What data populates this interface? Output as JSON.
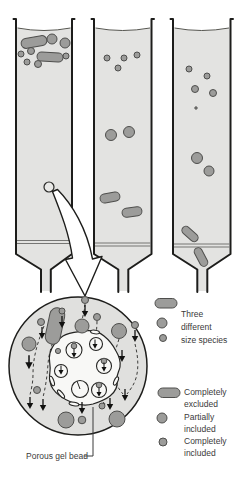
{
  "legend_species": {
    "lines": [
      "Three",
      "different",
      "size species"
    ]
  },
  "legend_inclusion": {
    "items": [
      {
        "shape": "rod",
        "line1": "Completely",
        "line2": "excluded"
      },
      {
        "shape": "medium-circle",
        "line1": "Partially",
        "line2": "included"
      },
      {
        "shape": "small-circle",
        "line1": "Completely",
        "line2": "included"
      }
    ]
  },
  "inset": {
    "label": "Porous gel bead"
  },
  "colors": {
    "background": "#ffffff",
    "column_fill": "#e3e3e1",
    "inset_fill": "#e0e0de",
    "particle_fill": "#9c9c9a",
    "particle_outline": "#4e4e4c",
    "outline_black": "#1d1d1b",
    "bead_fill": "#f8f8f6",
    "text": "#3a3a3a"
  }
}
